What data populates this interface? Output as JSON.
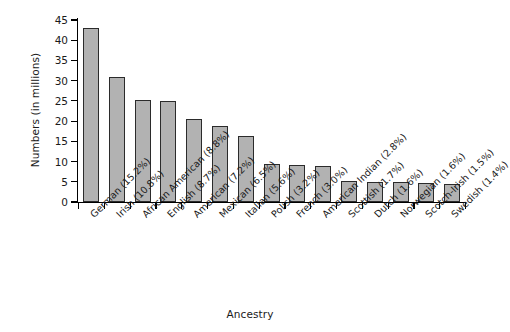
{
  "chart_data": {
    "type": "bar",
    "title": "",
    "xlabel": "Ancestry",
    "ylabel": "Numbers (in millions)",
    "ylim": [
      0,
      45
    ],
    "yticks": [
      0,
      5,
      10,
      15,
      20,
      25,
      30,
      35,
      40,
      45
    ],
    "grid": false,
    "legend": "none",
    "bar_color": "#b2b2b2",
    "bar_edge_color": "#2b2b2b",
    "categories": [
      "German (15.2%)",
      "Irish (10.8%)",
      "African American (8.8%)",
      "English (8.7%)",
      "American (7.2%)",
      "Mexican (6.5%)",
      "Italian (5.6%)",
      "Polish (3.2%)",
      "French (3.0%)",
      "American Indian (2.8%)",
      "Scottish (1.7%)",
      "Dutch (1.6%)",
      "Norwegian (1.6%)",
      "Scotch-Irish (1.5%)",
      "Swedish (1.4%)"
    ],
    "values": [
      43,
      31,
      25.2,
      24.9,
      20.5,
      18.7,
      16.2,
      9.5,
      9.1,
      9.0,
      5.3,
      5.0,
      4.9,
      4.8,
      4.4
    ],
    "percentages": [
      15.2,
      10.8,
      8.8,
      8.7,
      7.2,
      6.5,
      5.6,
      3.2,
      3.0,
      2.8,
      1.7,
      1.6,
      1.6,
      1.5,
      1.4
    ]
  }
}
